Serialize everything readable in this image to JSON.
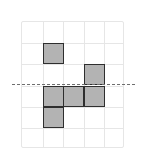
{
  "diagram": {
    "type": "grid-polyomino-with-reflection-line",
    "grid": {
      "columns": 5,
      "rows": 6,
      "line_color": "#e6e6e6"
    },
    "shaded_cells": [
      {
        "col": 1,
        "row": 1
      },
      {
        "col": 3,
        "row": 2
      },
      {
        "col": 1,
        "row": 3
      },
      {
        "col": 2,
        "row": 3
      },
      {
        "col": 3,
        "row": 3
      },
      {
        "col": 1,
        "row": 4
      }
    ],
    "cell_fill": "#b3b3b3",
    "cell_border": "#2e2e2e",
    "dashed_line": {
      "orientation": "horizontal",
      "at_row_boundary": 3,
      "color": "#6e6e6e"
    }
  }
}
